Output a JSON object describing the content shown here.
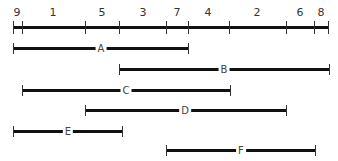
{
  "axis": {
    "y": 27,
    "x_start": 13,
    "x_end": 329,
    "ticks": [
      13,
      22,
      85,
      119,
      166,
      188,
      229,
      286,
      314,
      328
    ],
    "segment_labels": [
      {
        "text": "9",
        "x": 17
      },
      {
        "text": "1",
        "x": 53
      },
      {
        "text": "5",
        "x": 102
      },
      {
        "text": "3",
        "x": 143
      },
      {
        "text": "7",
        "x": 177
      },
      {
        "text": "4",
        "x": 208
      },
      {
        "text": "2",
        "x": 257
      },
      {
        "text": "6",
        "x": 300
      },
      {
        "text": "8",
        "x": 321
      }
    ]
  },
  "intervals": [
    {
      "label": "A",
      "y": 48,
      "x_start": 13,
      "x_end": 188,
      "label_x": 101
    },
    {
      "label": "B",
      "y": 69,
      "x_start": 119,
      "x_end": 329,
      "label_x": 224
    },
    {
      "label": "C",
      "y": 90,
      "x_start": 22,
      "x_end": 230,
      "label_x": 126
    },
    {
      "label": "D",
      "y": 110,
      "x_start": 85,
      "x_end": 286,
      "label_x": 185
    },
    {
      "label": "E",
      "y": 131,
      "x_start": 13,
      "x_end": 122,
      "label_x": 68
    },
    {
      "label": "F",
      "y": 150,
      "x_start": 166,
      "x_end": 315,
      "label_x": 241
    }
  ],
  "colors": {
    "line": "#111111",
    "tick": "#333333",
    "text": "#333333",
    "background": "#ffffff"
  }
}
